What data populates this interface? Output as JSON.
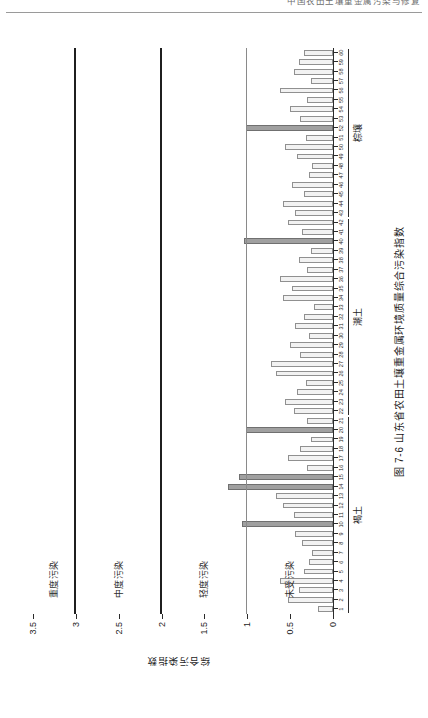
{
  "page": {
    "running_header": "中国农田土壤重金属污染与修复",
    "caption": "图 7-6  山东省农田土壤重金属环境质量综合污染指数"
  },
  "chart_data": {
    "type": "bar",
    "title": "图 7-6  山东省农田土壤重金属环境质量综合污染指数",
    "xlabel": "",
    "ylabel": "综合污染指数",
    "ylim": [
      0,
      3.5
    ],
    "ytick_labels": [
      "0",
      "0.5",
      "1",
      "1.5",
      "2",
      "2.5",
      "3",
      "3.5"
    ],
    "ytick_values": [
      0,
      0.5,
      1,
      1.5,
      2,
      2.5,
      3,
      3.5
    ],
    "grid": false,
    "legend_position": "none",
    "orientation": "vertical-bars-rotated-page",
    "categories": [
      "1",
      "2",
      "3",
      "4",
      "5",
      "6",
      "7",
      "8",
      "9",
      "10",
      "11",
      "12",
      "13",
      "14",
      "15",
      "16",
      "17",
      "18",
      "19",
      "20",
      "21",
      "22",
      "23",
      "24",
      "25",
      "26",
      "27",
      "28",
      "29",
      "30",
      "31",
      "32",
      "33",
      "34",
      "35",
      "36",
      "37",
      "38",
      "39",
      "40",
      "41",
      "42",
      "43",
      "44",
      "45",
      "46",
      "47",
      "48",
      "49",
      "50",
      "51",
      "52",
      "53",
      "54",
      "55",
      "56",
      "57",
      "58",
      "59",
      "60"
    ],
    "values": [
      0.18,
      0.52,
      0.4,
      0.62,
      0.34,
      0.28,
      0.24,
      0.36,
      0.44,
      1.06,
      0.46,
      0.58,
      0.66,
      1.22,
      1.1,
      0.3,
      0.52,
      0.38,
      0.26,
      1.02,
      0.3,
      0.46,
      0.56,
      0.42,
      0.32,
      0.66,
      0.72,
      0.38,
      0.5,
      0.28,
      0.44,
      0.34,
      0.22,
      0.58,
      0.48,
      0.62,
      0.3,
      0.4,
      0.26,
      1.04,
      0.36,
      0.52,
      0.44,
      0.58,
      0.34,
      0.48,
      0.28,
      0.24,
      0.42,
      0.56,
      0.32,
      1.02,
      0.38,
      0.5,
      0.3,
      0.62,
      0.26,
      0.46,
      0.4,
      0.34
    ],
    "threshold_lines": [
      {
        "value": 1,
        "label": "轻度污染起点"
      },
      {
        "value": 2,
        "label": "中度污染起点"
      },
      {
        "value": 3,
        "label": "重度污染起点"
      }
    ],
    "bands": [
      {
        "label": "未受污染",
        "from": 0,
        "to": 1
      },
      {
        "label": "轻度污染",
        "from": 1,
        "to": 2
      },
      {
        "label": "中度污染",
        "from": 2,
        "to": 3
      },
      {
        "label": "重度污染",
        "from": 3,
        "to": 3.5
      }
    ],
    "groups": [
      {
        "name": "褐土",
        "from": 1,
        "to": 21
      },
      {
        "name": "潮土",
        "from": 22,
        "to": 42
      },
      {
        "name": "棕壤",
        "from": 43,
        "to": 60
      }
    ],
    "series_colors": {
      "bar_fill": "#f2f2f2",
      "bar_stroke": "#909090",
      "bar_over_threshold_fill": "#a0a0a0",
      "bar_over_threshold_stroke": "#707070",
      "axis": "#2b2b2b",
      "band_divider": "#8a8a8a"
    }
  }
}
